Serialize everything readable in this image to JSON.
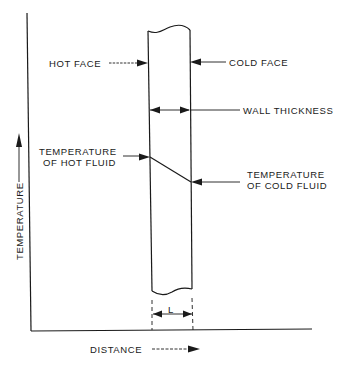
{
  "diagram": {
    "labels": {
      "hot_face": "HOT FACE",
      "cold_face": "COLD FACE",
      "wall_thickness": "WALL THICKNESS",
      "temp_hot_fluid_line1": "TEMPERATURE",
      "temp_hot_fluid_line2": "OF HOT FLUID",
      "temp_cold_fluid_line1": "TEMPERATURE",
      "temp_cold_fluid_line2": "OF COLD FLUID",
      "thickness_symbol": "L",
      "y_axis": "TEMPERATURE",
      "x_axis": "DISTANCE"
    },
    "colors": {
      "ink": "#1a1a1a",
      "background": "#ffffff"
    }
  }
}
